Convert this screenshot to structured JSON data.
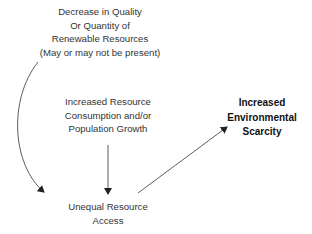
{
  "diagram": {
    "nodes": {
      "decrease": {
        "lines": [
          "Decrease in Quality",
          "Or Quantity of",
          "Renewable Resources",
          "(May or may not be present)"
        ]
      },
      "consumption": {
        "lines": [
          "Increased Resource",
          "Consumption and/or",
          "Population Growth"
        ]
      },
      "scarcity": {
        "lines": [
          "Increased",
          "Environmental",
          "Scarcity"
        ]
      },
      "unequal": {
        "lines": [
          "Unequal Resource",
          "Access"
        ]
      }
    },
    "edges": [
      {
        "from": "decrease",
        "to": "unequal",
        "style": "curved-arrow"
      },
      {
        "from": "consumption",
        "to": "unequal",
        "style": "straight-arrow"
      },
      {
        "from": "unequal",
        "to": "scarcity",
        "style": "straight-arrow"
      }
    ],
    "colors": {
      "text": "#333333",
      "bold_text": "#111111",
      "arrow": "#222222",
      "background": "#ffffff"
    }
  }
}
